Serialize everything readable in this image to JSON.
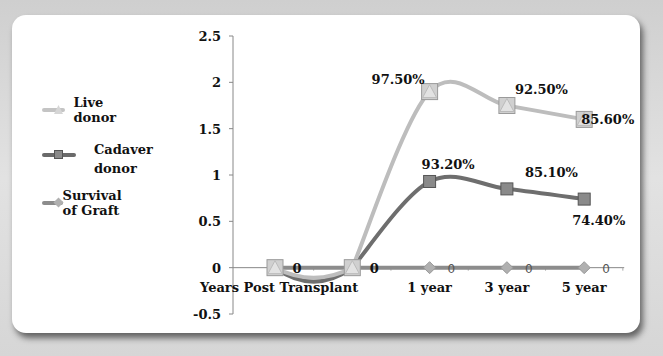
{
  "chart_data": {
    "type": "line",
    "title": "",
    "xlabel": "",
    "ylabel": "",
    "categories": [
      "Years Post Transplant",
      "",
      "1 year",
      "3 year",
      "5 year"
    ],
    "ylim": [
      -0.5,
      2.5
    ],
    "yticks": [
      "2.5",
      "2",
      "1.5",
      "1",
      "0.5",
      "0",
      "-0.5"
    ],
    "ytick_values": [
      2.5,
      2,
      1.5,
      1,
      0.5,
      0,
      -0.5
    ],
    "grid": false,
    "legend_position": "left",
    "series": [
      {
        "name": "Live donor",
        "color": "#bdbdbd",
        "marker": "triangle",
        "values": [
          0,
          0,
          1.9,
          1.75,
          1.6
        ],
        "data_labels": [
          "",
          "",
          "97.50%",
          "92.50%",
          "85.60%"
        ]
      },
      {
        "name": "Cadaver donor",
        "color": "#6e6e6e",
        "marker": "square",
        "values": [
          0,
          0,
          0.93,
          0.85,
          0.74
        ],
        "data_labels": [
          "0",
          "0",
          "93.20%",
          "85.10%",
          "74.40%"
        ]
      },
      {
        "name": "Survival of Graft",
        "color": "#8c8c8c",
        "marker": "diamond",
        "values": [
          0,
          0,
          0,
          0,
          0
        ],
        "data_labels": [
          "",
          "",
          "0",
          "0",
          "0"
        ]
      }
    ]
  },
  "legend": {
    "items": [
      "Live donor",
      "Cadaver donor",
      "Survival of Graft"
    ]
  }
}
